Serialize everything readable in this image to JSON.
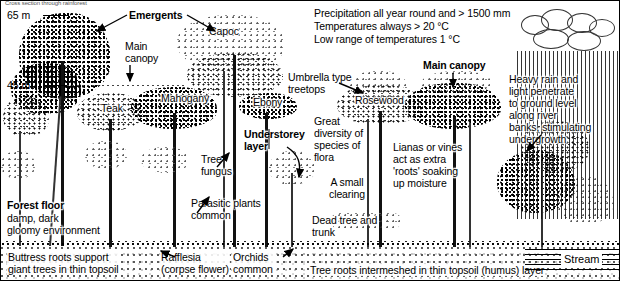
{
  "diagram": {
    "caption_top": "Cross section through rainforest",
    "scale": {
      "upper": "65 m",
      "lower": "45 m"
    },
    "climate_block": {
      "line1": "Precipitation all year round and > 1500 mm",
      "line2": "Temperatures always > 20 °C",
      "line3": "Low range of temperatures 1 °C"
    },
    "layer_labels": {
      "emergents": "Emergents",
      "main_canopy_left": "Main\ncanopy",
      "main_canopy_right": "Main canopy",
      "understorey": "Understorey\nlayer",
      "forest_floor_title": "Forest floor",
      "forest_floor_body": "damp, dark\ngloomy environment"
    },
    "species_labels": {
      "capoc": "Capoc",
      "teak": "Teak",
      "mahogany": "Mahogany",
      "ebony": "Ebony",
      "rosewood": "Rosewood"
    },
    "annotations": {
      "umbrella": "Umbrella type\ntreetops",
      "tree_fungus": "Tree\nfungus",
      "parasitic": "Parasitic plants\ncommon",
      "diversity": "Great\ndiversity of\nspecies of\nflora",
      "clearing": "A small\nclearing",
      "dead_tree": "Dead tree and\ntrunk",
      "lianas": "Lianas or vines\nact as extra\n'roots' soaking\nup moisture",
      "heavy_rain": "Heavy rain and\nlight penetrate\nto ground level\nalong river\nbanks, stimulating\nundergrowth"
    },
    "ground_labels": {
      "buttress": "Buttress roots support\ngiant trees in thin topsoil",
      "rafflesia": "Rafflesia\n(corpse flower)",
      "orchids": "Orchids\ncommon",
      "tree_roots": "Tree roots intermeshed in thin topsoil (humus) layer",
      "stream": "Stream"
    },
    "colors": {
      "ink": "#000000",
      "paper": "#ffffff",
      "soil": "#888888"
    }
  }
}
